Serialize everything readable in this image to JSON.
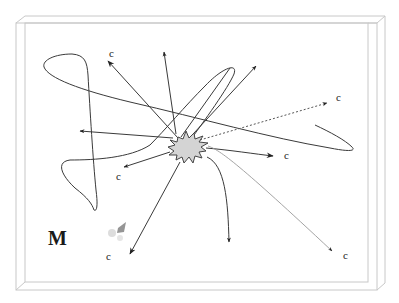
{
  "diagram": {
    "title_label": "M",
    "target_label": "c",
    "colors": {
      "frame": "#c8c8c8",
      "line": "#3a3a3a",
      "burst_fill": "#d4d4d4",
      "burst_stroke": "#444444",
      "smudge": "#7a7a7a"
    },
    "labels": [
      {
        "id": "c-top-left",
        "text": "c",
        "x": 109,
        "y": 57
      },
      {
        "id": "c-right-dotted",
        "text": "c",
        "x": 336,
        "y": 101
      },
      {
        "id": "c-mid-right",
        "text": "c",
        "x": 284,
        "y": 159
      },
      {
        "id": "c-mid-left",
        "text": "c",
        "x": 116,
        "y": 180
      },
      {
        "id": "c-bottom-left",
        "text": "c",
        "x": 106,
        "y": 260
      },
      {
        "id": "c-bottom-right",
        "text": "c",
        "x": 343,
        "y": 259
      }
    ],
    "m_label": {
      "text": "M",
      "x": 48,
      "y": 245
    }
  }
}
